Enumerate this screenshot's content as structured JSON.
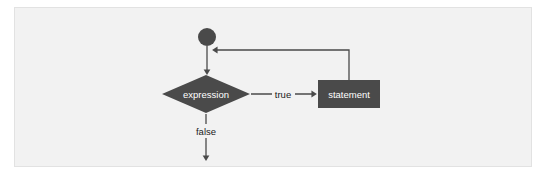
{
  "figure": {
    "kind": "flowchart",
    "panel": {
      "background_color": "#f2f2f2",
      "border_color": "#e2e2e2"
    },
    "colors": {
      "shape_fill": "#4a4a4a",
      "shape_text": "#ffffff",
      "edge_line": "#4a4a4a",
      "edge_text": "#1a1a1a"
    }
  },
  "nodes": {
    "start": {
      "type": "circle",
      "label": "",
      "cx": 207,
      "cy": 37,
      "r": 9
    },
    "condition": {
      "type": "diamond",
      "label": "expression",
      "cx": 206,
      "cy": 94,
      "width": 88,
      "height": 38
    },
    "body": {
      "type": "rectangle",
      "label": "statement",
      "x": 318,
      "y": 80,
      "width": 62,
      "height": 28
    }
  },
  "edges": {
    "start_to_condition": {
      "label": "",
      "from": "start",
      "to": "condition"
    },
    "condition_true": {
      "label": "true",
      "from": "condition",
      "to": "body",
      "label_x": 283,
      "label_y": 94
    },
    "condition_false": {
      "label": "false",
      "from": "condition",
      "to": "exit",
      "label_x": 206,
      "label_y": 131
    },
    "body_loop_back": {
      "label": "",
      "from": "body",
      "to": "start_to_condition",
      "corner_x": 349,
      "corner_y": 50
    }
  }
}
